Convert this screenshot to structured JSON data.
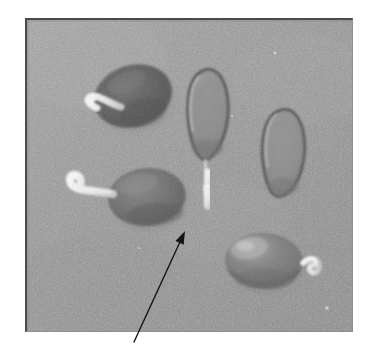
{
  "figure": {
    "domain": "Natural-Image",
    "kind": "grayscale-photograph",
    "page_background": "#ffffff",
    "photo": {
      "x": 25,
      "y": 18,
      "width": 328,
      "height": 314,
      "substrate_color": "#969696",
      "substrate_light": "#a6a6a6",
      "substrate_dark": "#8a8a8a",
      "border_color_top_left": "#4a4a4a",
      "border_color_bottom_right": "#8e8e8e",
      "grain": "fine dithered halftone noise"
    },
    "specimens": [
      {
        "id": "seed-top-left",
        "label": "dark oval seed with short sprout",
        "shape": "oval",
        "cx": 130,
        "cy": 90,
        "rx": 38,
        "ry": 29,
        "rotation": -18,
        "fill": "#5f5f5f",
        "fill_edge": "#787878",
        "outline": "#4b4b4b",
        "sprout": {
          "present": true,
          "position": "upper-left",
          "color": "#ebebeb",
          "length": "short",
          "shape": "hooked"
        }
      },
      {
        "id": "seed-top-middle",
        "label": "teardrop seed with long white root",
        "shape": "teardrop",
        "cx": 189,
        "cy": 124,
        "rx": 24,
        "ry": 45,
        "rotation": 4,
        "fill": "#8d8d8d",
        "fill_edge": "#7c7c7c",
        "outline": "#565656",
        "sprout": {
          "present": true,
          "position": "below",
          "color": "#f0f0f0",
          "length": "long",
          "shape": "straight-segmented"
        }
      },
      {
        "id": "seed-right",
        "label": "teardrop seed without sprout",
        "shape": "teardrop",
        "cx": 283,
        "cy": 143,
        "rx": 23,
        "ry": 40,
        "rotation": 2,
        "fill": "#8e8e8e",
        "fill_edge": "#7e7e7e",
        "outline": "#5a5a5a",
        "sprout": {
          "present": false
        }
      },
      {
        "id": "seed-middle-left",
        "label": "oval seed with long leftward sprout",
        "shape": "oval",
        "cx": 145,
        "cy": 194,
        "rx": 37,
        "ry": 27,
        "rotation": -6,
        "fill": "#6e6e6e",
        "fill_edge": "#848484",
        "outline": "#545454",
        "sprout": {
          "present": true,
          "position": "left",
          "color": "#f2f2f2",
          "length": "long",
          "shape": "hooked-tail"
        }
      },
      {
        "id": "seed-bottom-right",
        "label": "oval seed with curled white hook",
        "shape": "oval",
        "cx": 262,
        "cy": 259,
        "rx": 37,
        "ry": 26,
        "rotation": 3,
        "fill": "#7a7a7a",
        "fill_edge": "#8f8f8f",
        "outline": "#5d5d5d",
        "sprout": {
          "present": true,
          "position": "right",
          "color": "#ededed",
          "length": "short",
          "shape": "curled-hook"
        }
      }
    ],
    "annotation": {
      "type": "arrow",
      "color": "#141414",
      "stroke_width": 1.4,
      "tail_x": 134,
      "tail_y": 342,
      "head_x": 185,
      "head_y": 231,
      "points_to": "seed-top-middle root",
      "head_length": 13,
      "head_width": 9
    }
  }
}
